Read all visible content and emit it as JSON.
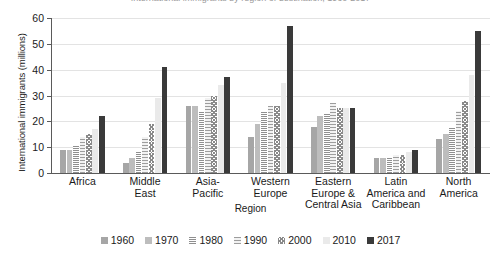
{
  "chart_data": {
    "type": "bar",
    "title": "International immigrants by region of destination, 1960-2017",
    "xlabel": "Region",
    "ylabel": "International immigrants (millions)",
    "ylim": [
      0,
      60
    ],
    "yticks": [
      0,
      10,
      20,
      30,
      40,
      50,
      60
    ],
    "grid": true,
    "legend_position": "bottom",
    "categories": [
      "Africa",
      "Middle\nEast",
      "Asia-\nPacific",
      "Western\nEurope",
      "Eastern\nEurope &\nCentral Asia",
      "Latin\nAmerica and\nCaribbean",
      "North\nAmerica"
    ],
    "series": [
      {
        "name": "1960",
        "color": "#a6a6a6",
        "values": [
          9,
          4,
          26,
          14,
          18,
          6,
          13
        ]
      },
      {
        "name": "1970",
        "color": "#bdbdbd",
        "values": [
          9,
          6,
          26,
          19,
          22,
          6,
          15
        ]
      },
      {
        "name": "1980",
        "color": "#8f8f8f",
        "values": [
          11,
          8,
          24,
          24,
          23,
          6,
          18
        ]
      },
      {
        "name": "1990",
        "color": "#9d9d9d",
        "values": [
          14,
          14,
          29,
          26,
          27,
          7,
          24
        ]
      },
      {
        "name": "2000",
        "color": "#8a8a8a",
        "values": [
          15,
          19,
          30,
          26,
          25,
          7,
          28
        ]
      },
      {
        "name": "2010",
        "color": "#eaeaea",
        "values": [
          17,
          29,
          34,
          35,
          25,
          8,
          38
        ]
      },
      {
        "name": "2017",
        "color": "#3a3a3a",
        "values": [
          22,
          41,
          37,
          57,
          25,
          9,
          55
        ]
      }
    ]
  }
}
